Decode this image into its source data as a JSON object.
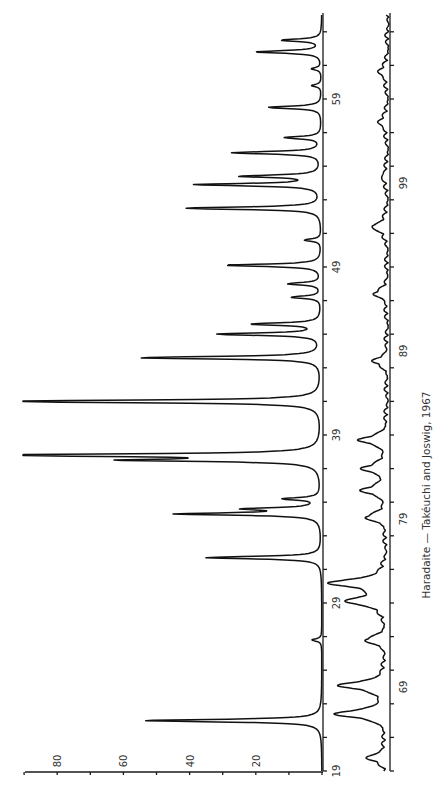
{
  "chart_data": {
    "type": "line",
    "title": "Haradaite — Takéuchi and Joswig, 1967",
    "orientation": "rotated-90-ccw",
    "xlabel": "2θ (degrees)",
    "ylabel": "Relative intensity",
    "ylim": [
      0,
      90
    ],
    "intensity_ticks": [
      "20",
      "40",
      "60",
      "80"
    ],
    "panels": [
      {
        "name": "main",
        "xlim": [
          19,
          64
        ],
        "x_tick_labels": [
          "19",
          "29",
          "39",
          "49",
          "59"
        ],
        "x_minor_step": 2,
        "peaks": [
          {
            "two_theta": 22.0,
            "intensity": 54
          },
          {
            "two_theta": 26.8,
            "intensity": 3
          },
          {
            "two_theta": 31.7,
            "intensity": 35
          },
          {
            "two_theta": 34.3,
            "intensity": 43
          },
          {
            "two_theta": 34.6,
            "intensity": 21
          },
          {
            "two_theta": 35.2,
            "intensity": 11
          },
          {
            "two_theta": 37.5,
            "intensity": 55
          },
          {
            "two_theta": 37.8,
            "intensity": 100
          },
          {
            "two_theta": 41.0,
            "intensity": 100
          },
          {
            "two_theta": 43.6,
            "intensity": 55
          },
          {
            "two_theta": 45.0,
            "intensity": 31
          },
          {
            "two_theta": 45.6,
            "intensity": 21
          },
          {
            "two_theta": 47.2,
            "intensity": 9
          },
          {
            "two_theta": 48.0,
            "intensity": 10
          },
          {
            "two_theta": 49.1,
            "intensity": 29
          },
          {
            "two_theta": 50.6,
            "intensity": 5
          },
          {
            "two_theta": 52.5,
            "intensity": 41
          },
          {
            "two_theta": 53.9,
            "intensity": 38
          },
          {
            "two_theta": 54.4,
            "intensity": 24
          },
          {
            "two_theta": 55.8,
            "intensity": 27
          },
          {
            "two_theta": 56.7,
            "intensity": 11
          },
          {
            "two_theta": 58.5,
            "intensity": 16
          },
          {
            "two_theta": 59.8,
            "intensity": 3
          },
          {
            "two_theta": 60.8,
            "intensity": 3
          },
          {
            "two_theta": 61.8,
            "intensity": 20
          },
          {
            "two_theta": 62.5,
            "intensity": 12
          }
        ]
      },
      {
        "name": "continuation",
        "xlim": [
          64,
          109
        ],
        "x_tick_labels": [
          "69",
          "79",
          "89",
          "99"
        ],
        "x_minor_step": 2,
        "peaks": [
          {
            "two_theta": 64.8,
            "intensity": 6
          },
          {
            "two_theta": 67.4,
            "intensity": 15
          },
          {
            "two_theta": 69.1,
            "intensity": 14
          },
          {
            "two_theta": 71.8,
            "intensity": 6
          },
          {
            "two_theta": 74.1,
            "intensity": 12
          },
          {
            "two_theta": 75.2,
            "intensity": 17
          },
          {
            "two_theta": 79.1,
            "intensity": 6
          },
          {
            "two_theta": 80.7,
            "intensity": 7
          },
          {
            "two_theta": 82.0,
            "intensity": 7
          },
          {
            "two_theta": 83.7,
            "intensity": 8
          },
          {
            "two_theta": 88.4,
            "intensity": 4
          },
          {
            "two_theta": 92.4,
            "intensity": 4
          },
          {
            "two_theta": 96.4,
            "intensity": 5
          },
          {
            "two_theta": 99.4,
            "intensity": 2
          },
          {
            "two_theta": 102.6,
            "intensity": 3
          },
          {
            "two_theta": 105.6,
            "intensity": 3
          }
        ]
      }
    ],
    "grid": false,
    "legend": null
  },
  "caption": "Haradaite — Takéuchi and Joswig, 1967"
}
